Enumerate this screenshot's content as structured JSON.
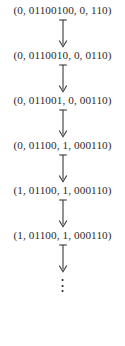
{
  "figure": {
    "type": "configuration-sequence",
    "text_color": "#2b2b2b",
    "arrow_color": "#3a3a3a",
    "background_color": "#ffffff",
    "arrow_icon_name": "down-arrow-icon",
    "steps": [
      {
        "label": "(0, 01100100, 0, 110)"
      },
      {
        "label": "(0, 0110010, 0, 0110)"
      },
      {
        "label": "(0, 011001, 0, 00110)"
      },
      {
        "label": "(0, 01100, 1, 000110)"
      },
      {
        "label": "(1, 01100, 1, 000110)"
      },
      {
        "label": "(1, 01100, 1, 000110)"
      }
    ],
    "continuation": "⋮"
  }
}
